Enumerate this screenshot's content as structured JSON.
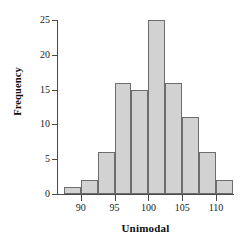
{
  "chart_data": {
    "type": "bar",
    "title": "",
    "xlabel": "Unimodal",
    "ylabel": "Frequency",
    "categories": [
      "87.5-90",
      "90-92.5",
      "92.5-95",
      "95-97.5",
      "97.5-100",
      "100-102.5",
      "102.5-105",
      "105-107.5",
      "107.5-110",
      "110-112.5"
    ],
    "bin_edges": [
      87.5,
      90,
      92.5,
      95,
      97.5,
      100,
      102.5,
      105,
      107.5,
      110,
      112.5
    ],
    "values": [
      1,
      2,
      6,
      16,
      15,
      25,
      16,
      11,
      6,
      2
    ],
    "xlim": [
      86.5,
      112.5
    ],
    "ylim": [
      0,
      25
    ],
    "x_ticks": [
      90,
      95,
      100,
      105,
      110
    ],
    "x_tick_labels": [
      "90",
      "95",
      "100",
      "105",
      "110"
    ],
    "y_ticks": [
      0,
      5,
      10,
      15,
      20,
      25
    ],
    "y_tick_labels": [
      "0",
      "5",
      "10",
      "15",
      "20",
      "25"
    ],
    "grid": false,
    "legend": false,
    "bar_fill_color": "#d2d2d2",
    "bar_edge_color": "#6d6d6d",
    "axis_color": "#4a4a4a"
  }
}
